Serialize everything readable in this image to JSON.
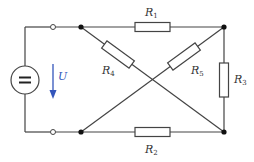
{
  "diagram": {
    "type": "circuit",
    "colors": {
      "wire": "#444444",
      "arrow": "#3355bb",
      "background": "#ffffff"
    },
    "source": {
      "symbol": "=",
      "voltage_label": "U"
    },
    "resistors": [
      {
        "id": "R1",
        "main": "R",
        "sub": "1"
      },
      {
        "id": "R2",
        "main": "R",
        "sub": "2"
      },
      {
        "id": "R3",
        "main": "R",
        "sub": "3"
      },
      {
        "id": "R4",
        "main": "R",
        "sub": "4"
      },
      {
        "id": "R5",
        "main": "R",
        "sub": "5"
      }
    ]
  }
}
